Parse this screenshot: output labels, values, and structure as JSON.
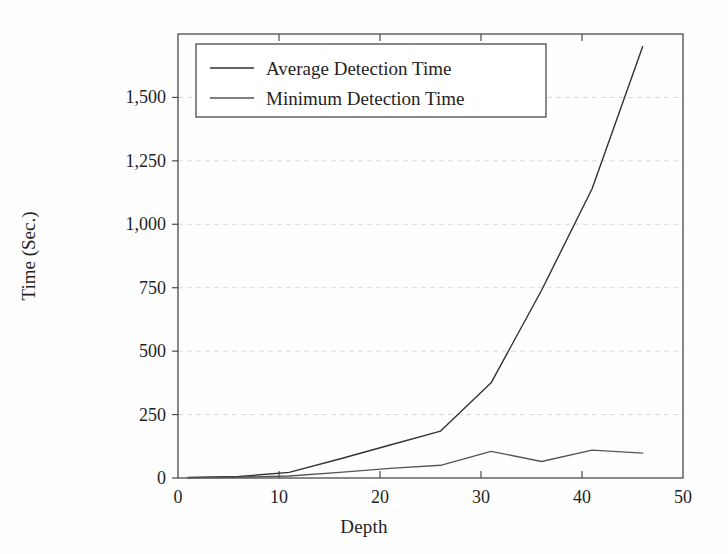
{
  "chart_data": {
    "type": "line",
    "title": "",
    "xlabel": "Depth",
    "ylabel": "Time (Sec.)",
    "xlim": [
      0,
      50
    ],
    "ylim": [
      0,
      1750
    ],
    "grid": true,
    "legend_position": "top-left",
    "xticks": [
      0,
      10,
      20,
      30,
      40,
      50
    ],
    "xtick_labels": [
      "0",
      "10",
      "20",
      "30",
      "40",
      "50"
    ],
    "yticks": [
      0,
      250,
      500,
      750,
      1000,
      1250,
      1500
    ],
    "ytick_labels": [
      "0",
      "250",
      "500",
      "750",
      "1,000",
      "1,250",
      "1,500"
    ],
    "series": [
      {
        "name": "Average Detection Time",
        "color": "#333333",
        "x": [
          1,
          6,
          11,
          16,
          21,
          26,
          31,
          36,
          41,
          46
        ],
        "values": [
          2,
          6,
          22,
          75,
          130,
          185,
          375,
          740,
          1140,
          1700
        ]
      },
      {
        "name": "Minimum Detection Time",
        "color": "#555555",
        "x": [
          1,
          6,
          11,
          16,
          21,
          26,
          31,
          36,
          41,
          46
        ],
        "values": [
          1,
          3,
          8,
          22,
          38,
          50,
          105,
          65,
          110,
          98
        ]
      }
    ]
  },
  "legend": {
    "entries": [
      {
        "label": "Average Detection Time"
      },
      {
        "label": "Minimum Detection Time"
      }
    ]
  },
  "colors": {
    "background": "#fefefe",
    "axis": "#4a4a4a",
    "grid": "#d8d8d8",
    "text": "#1f1f1f",
    "average_series": "#333333",
    "minimum_series": "#555555"
  }
}
